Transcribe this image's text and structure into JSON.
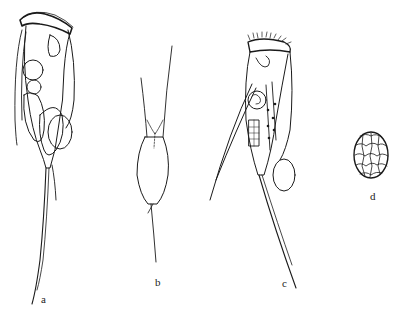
{
  "figure": {
    "panels": [
      {
        "id": "a",
        "label": "a",
        "subject": "rotifer-lateral-view-stippled"
      },
      {
        "id": "b",
        "label": "b",
        "subject": "lorica-outline-with-spines"
      },
      {
        "id": "c",
        "label": "c",
        "subject": "rotifer-lateral-view-line"
      },
      {
        "id": "d",
        "label": "d",
        "subject": "egg-with-polygonal-surface"
      }
    ],
    "colors": {
      "ink": "#1a1a1a",
      "background": "#ffffff",
      "stipple": "#555555"
    }
  }
}
